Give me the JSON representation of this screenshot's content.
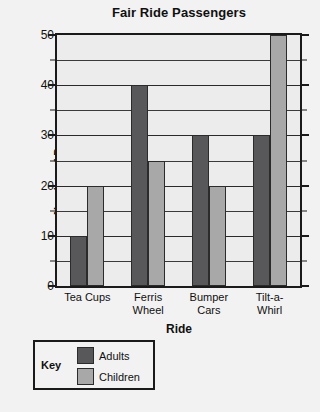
{
  "chart_data": {
    "type": "bar",
    "title": "Fair Ride Passengers",
    "xlabel": "Ride",
    "ylabel": "Number of Passengers",
    "categories": [
      "Tea Cups",
      "Ferris Wheel",
      "Bumper Cars",
      "Tilt-a-Whirl"
    ],
    "category_lines": [
      [
        "Tea Cups"
      ],
      [
        "Ferris",
        "Wheel"
      ],
      [
        "Bumper",
        "Cars"
      ],
      [
        "Tilt-a-",
        "Whirl"
      ]
    ],
    "series": [
      {
        "name": "Adults",
        "color": "#58585a",
        "values": [
          10,
          40,
          30,
          30
        ]
      },
      {
        "name": "Children",
        "color": "#a8a8a8",
        "values": [
          20,
          25,
          20,
          50
        ]
      }
    ],
    "ylim": [
      0,
      50
    ],
    "ytick_labels": [
      "0",
      "10",
      "20",
      "30",
      "40",
      "50"
    ],
    "ytick_values": [
      0,
      10,
      20,
      30,
      40,
      50
    ],
    "minor_tick_step": 5,
    "grid": true,
    "legend_position": "below-left",
    "legend_title": "Key"
  },
  "legend": {
    "title": "Key",
    "entries": [
      {
        "label": "Adults",
        "color": "#58585a"
      },
      {
        "label": "Children",
        "color": "#a8a8a8"
      }
    ]
  }
}
